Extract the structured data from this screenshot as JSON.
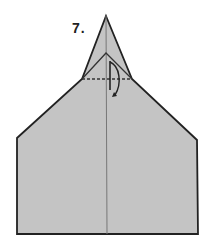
{
  "step": {
    "label": "7."
  },
  "colors": {
    "paper": "#c4c4c4",
    "outline": "#222222",
    "crease": "#777777",
    "background": "#ffffff"
  },
  "shapes": {
    "outline_points": "106,16 132,79 197,140 198,234 17,234 17,138 82,79",
    "inner_flap_points": "106,53 132,79 82,79",
    "center_line": {
      "x1": 106,
      "y1": 16,
      "x2": 107,
      "y2": 234
    },
    "fold_line_dashed": {
      "x1": 82,
      "y1": 79,
      "x2": 132,
      "y2": 79
    }
  },
  "annotations": {
    "fold_arrow": "fold tip down along dashed line"
  }
}
